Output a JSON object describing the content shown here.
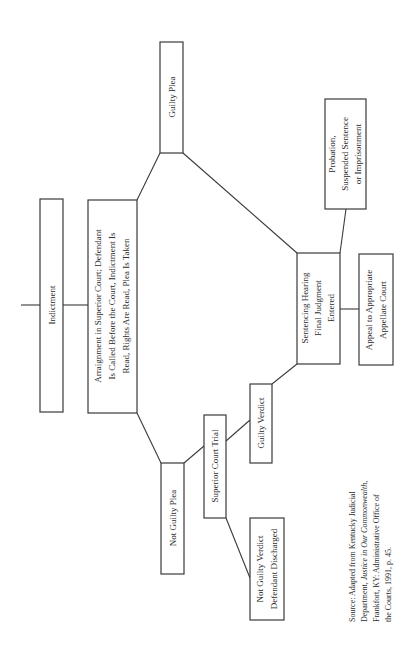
{
  "diagram": {
    "type": "flowchart",
    "orientation": "rotated-90-ccw",
    "nodes": {
      "indictment": {
        "lines": [
          "Indictment"
        ]
      },
      "arraignment": {
        "lines": [
          "Arraignment in Superior Court; Defendant",
          "Is Called Before the Court, Indictment Is",
          "Read, Rights Are Read, Plea Is Taken"
        ]
      },
      "guilty_plea": {
        "lines": [
          "Guilty Plea"
        ]
      },
      "not_guilty_plea": {
        "lines": [
          "Not Guilty Plea"
        ]
      },
      "superior_court_trial": {
        "lines": [
          "Superior Court Trial"
        ]
      },
      "guilty_verdict": {
        "lines": [
          "Guilty Verdict"
        ]
      },
      "not_guilty_verdict": {
        "lines": [
          "Not Guilty Verdict",
          "Defendant Discharged"
        ]
      },
      "sentencing": {
        "lines": [
          "Sentencing Hearing",
          "Final Judgment",
          "Entered"
        ]
      },
      "probation": {
        "lines": [
          "Probation,",
          "Suspended Sentence",
          "or Imprisonment"
        ]
      },
      "appeal": {
        "lines": [
          "Appeal to Appropriate",
          "Appellate Court"
        ]
      }
    },
    "edges": [
      [
        "indictment",
        "arraignment"
      ],
      [
        "arraignment",
        "guilty_plea"
      ],
      [
        "arraignment",
        "not_guilty_plea"
      ],
      [
        "guilty_plea",
        "sentencing"
      ],
      [
        "not_guilty_plea",
        "superior_court_trial"
      ],
      [
        "superior_court_trial",
        "guilty_verdict"
      ],
      [
        "superior_court_trial",
        "not_guilty_verdict"
      ],
      [
        "guilty_verdict",
        "sentencing"
      ],
      [
        "sentencing",
        "probation"
      ],
      [
        "sentencing",
        "appeal"
      ]
    ]
  },
  "source": {
    "line1": "Source: Adapted from Kentucky Judicial",
    "line2_a": "Department, ",
    "line2_b": "Justice in Our Commonwealth,",
    "line3": "Frankfort, KY: Administrative Office of",
    "line4": "the Courts, 1991, p. 45."
  }
}
